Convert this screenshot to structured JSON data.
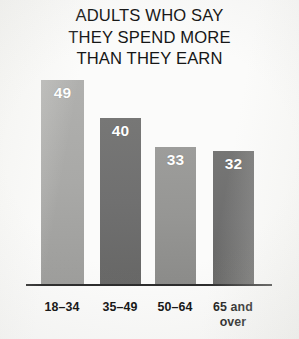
{
  "chart_data": {
    "type": "bar",
    "title": "ADULTS WHO SAY THEY SPEND MORE THAN THEY EARN",
    "title_lines": [
      "ADULTS WHO SAY",
      "THEY SPEND MORE",
      "THAN THEY EARN"
    ],
    "xlabel": "",
    "ylabel": "",
    "ylim": [
      0,
      55
    ],
    "grid": false,
    "legend": "none",
    "value_label_color": "#ffffff",
    "axis_line_color": "#2b2b2b",
    "background_color": "#fbfbfa",
    "categories": [
      "18–34",
      "35–49",
      "50–64",
      "65 and over"
    ],
    "values": [
      49,
      40,
      33,
      32
    ],
    "bars": [
      {
        "category": "18–34",
        "category_line1": "18–34",
        "category_line2": "",
        "value": 49,
        "value_label": "49",
        "color": "#a9a9a7",
        "color_top": "#b0b0ae",
        "color_bottom": "#9d9d9b"
      },
      {
        "category": "35–49",
        "category_line1": "35–49",
        "category_line2": "",
        "value": 40,
        "value_label": "40",
        "color": "#707070",
        "color_top": "#777776",
        "color_bottom": "#676766"
      },
      {
        "category": "50–64",
        "category_line1": "50–64",
        "category_line2": "",
        "value": 33,
        "value_label": "33",
        "color": "#969694",
        "color_top": "#9d9d9b",
        "color_bottom": "#8b8b89"
      },
      {
        "category": "65 and over",
        "category_line1": "65 and",
        "category_line2": "over",
        "value": 32,
        "value_label": "32",
        "color": "#6f6f6f",
        "color_top": "#767675",
        "color_bottom": "#656564"
      }
    ]
  }
}
